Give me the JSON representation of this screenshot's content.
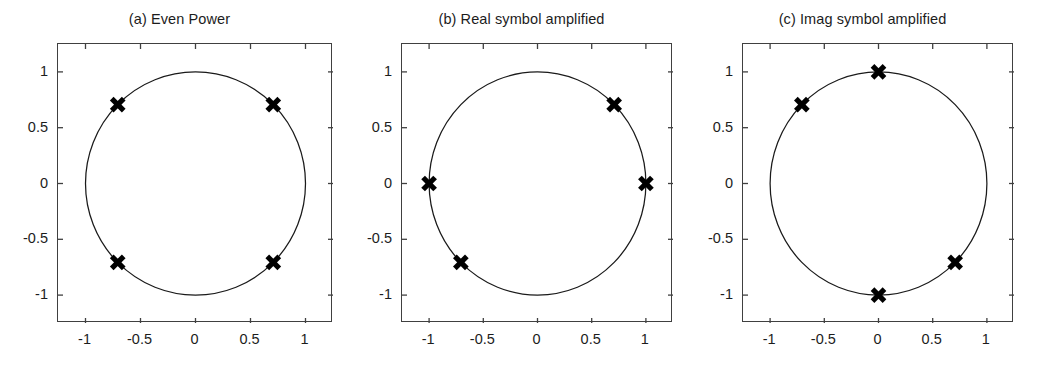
{
  "figure": {
    "background_color": "#ffffff",
    "axis_color": "#404040",
    "marker_color": "#000000",
    "curve_color": "#1a1a1a",
    "width": 1039,
    "height": 365
  },
  "panels": [
    {
      "id": "panel-a",
      "title": "(a) Even Power",
      "box": {
        "left": 57,
        "top": 43,
        "width": 275,
        "height": 279
      },
      "chart_data": {
        "type": "scatter",
        "title": "(a) Even Power",
        "xlabel": "",
        "ylabel": "",
        "xlim": [
          -1.25,
          1.25
        ],
        "ylim": [
          -1.25,
          1.25
        ],
        "xticks": [
          -1,
          -0.5,
          0,
          0.5,
          1
        ],
        "yticks": [
          -1,
          -0.5,
          0,
          0.5,
          1
        ],
        "xticklabels": [
          "-1",
          "-0.5",
          "0",
          "0.5",
          "1"
        ],
        "yticklabels": [
          "-1",
          "-0.5",
          "0",
          "0.5",
          "1"
        ],
        "grid": false,
        "legend": null,
        "series": [
          {
            "name": "unit circle",
            "type": "line",
            "radius": 1.0,
            "center": [
              0,
              0
            ]
          },
          {
            "name": "constellation points",
            "type": "scatter",
            "marker": "x",
            "x": [
              0.707,
              -0.707,
              -0.707,
              0.707
            ],
            "y": [
              0.707,
              0.707,
              -0.707,
              -0.707
            ]
          }
        ]
      }
    },
    {
      "id": "panel-b",
      "title": "(b) Real symbol amplified",
      "box": {
        "left": 401,
        "top": 43,
        "width": 271,
        "height": 279
      },
      "chart_data": {
        "type": "scatter",
        "title": "(b) Real symbol amplified",
        "xlabel": "",
        "ylabel": "",
        "xlim": [
          -1.25,
          1.25
        ],
        "ylim": [
          -1.25,
          1.25
        ],
        "xticks": [
          -1,
          -0.5,
          0,
          0.5,
          1
        ],
        "yticks": [
          -1,
          -0.5,
          0,
          0.5,
          1
        ],
        "xticklabels": [
          "-1",
          "-0.5",
          "0",
          "0.5",
          "1"
        ],
        "yticklabels": [
          "-1",
          "-0.5",
          "0",
          "0.5",
          "1"
        ],
        "grid": false,
        "legend": null,
        "series": [
          {
            "name": "unit circle",
            "type": "line",
            "radius": 1.0,
            "center": [
              0,
              0
            ]
          },
          {
            "name": "constellation points",
            "type": "scatter",
            "marker": "x",
            "x": [
              1.0,
              0.707,
              -1.0,
              -0.707
            ],
            "y": [
              0.0,
              0.707,
              0.0,
              -0.707
            ]
          }
        ]
      }
    },
    {
      "id": "panel-c",
      "title": "(c) Imag symbol amplified",
      "box": {
        "left": 742,
        "top": 43,
        "width": 271,
        "height": 279
      },
      "chart_data": {
        "type": "scatter",
        "title": "(c) Imag symbol amplified",
        "xlabel": "",
        "ylabel": "",
        "xlim": [
          -1.25,
          1.25
        ],
        "ylim": [
          -1.25,
          1.25
        ],
        "xticks": [
          -1,
          -0.5,
          0,
          0.5,
          1
        ],
        "yticks": [
          -1,
          -0.5,
          0,
          0.5,
          1
        ],
        "xticklabels": [
          "-1",
          "-0.5",
          "0",
          "0.5",
          "1"
        ],
        "yticklabels": [
          "-1",
          "-0.5",
          "0",
          "0.5",
          "1"
        ],
        "grid": false,
        "legend": null,
        "series": [
          {
            "name": "unit circle",
            "type": "line",
            "radius": 1.0,
            "center": [
              0,
              0
            ]
          },
          {
            "name": "constellation points",
            "type": "scatter",
            "marker": "x",
            "x": [
              0.0,
              -0.707,
              0.0,
              0.707
            ],
            "y": [
              1.0,
              0.707,
              -1.0,
              -0.707
            ]
          }
        ]
      }
    }
  ]
}
